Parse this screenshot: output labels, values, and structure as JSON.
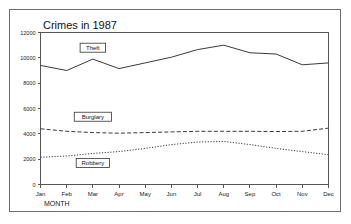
{
  "chart_data": {
    "type": "line",
    "title": "Crimes in 1987",
    "xlabel": "MONTH",
    "ylabel": "",
    "categories": [
      "Jan",
      "Feb",
      "Mar",
      "Apr",
      "May",
      "Jun",
      "Jul",
      "Aug",
      "Sep",
      "Oct",
      "Nov",
      "Dec"
    ],
    "ylim": [
      0,
      12000
    ],
    "ytick_labels": [
      "0",
      "2000",
      "4000",
      "6000",
      "8000",
      "10000",
      "12000"
    ],
    "ytick_values": [
      0,
      2000,
      4000,
      6000,
      8000,
      10000,
      12000
    ],
    "grid": false,
    "legend_position": "inline-labels",
    "series": [
      {
        "name": "Theft",
        "style": "solid",
        "values": [
          9400,
          9000,
          9900,
          9150,
          9600,
          10050,
          10650,
          11000,
          10400,
          10300,
          9450,
          9600
        ],
        "label_anchor": {
          "x_index": 2,
          "value": 10800
        }
      },
      {
        "name": "Burglary",
        "style": "dashed",
        "values": [
          4400,
          4200,
          4100,
          4050,
          4100,
          4150,
          4200,
          4200,
          4200,
          4180,
          4200,
          4450
        ],
        "label_anchor": {
          "x_index": 2,
          "value": 5350
        }
      },
      {
        "name": "Robbery",
        "style": "dotted",
        "values": [
          2150,
          2250,
          2450,
          2600,
          2850,
          3150,
          3350,
          3400,
          3150,
          2850,
          2600,
          2350
        ],
        "label_anchor": {
          "x_index": 2,
          "value": 1700
        }
      }
    ]
  },
  "axis": {
    "x_title": "MONTH"
  }
}
